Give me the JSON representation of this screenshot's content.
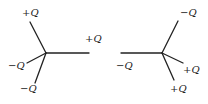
{
  "figures": [
    {
      "name": "left-configuration",
      "center": [
        46,
        53
      ],
      "arms": [
        {
          "end": [
            30,
            22
          ],
          "label": "+Q",
          "label_pos": [
            22,
            16
          ]
        },
        {
          "end": [
            89,
            53
          ],
          "label": "+Q",
          "label_pos": [
            85,
            42
          ]
        },
        {
          "end": [
            27,
            63
          ],
          "label": "−Q",
          "label_pos": [
            8,
            69
          ]
        },
        {
          "end": [
            35,
            83
          ],
          "label": "−Q",
          "label_pos": [
            20,
            92
          ]
        }
      ]
    },
    {
      "name": "right-configuration",
      "center": [
        162,
        53
      ],
      "arms": [
        {
          "end": [
            178,
            21
          ],
          "label": "−Q",
          "label_pos": [
            180,
            16
          ]
        },
        {
          "end": [
            121,
            53
          ],
          "label": "−Q",
          "label_pos": [
            116,
            69
          ]
        },
        {
          "end": [
            183,
            63
          ],
          "label": "+Q",
          "label_pos": [
            183,
            73
          ]
        },
        {
          "end": [
            174,
            80
          ],
          "label": "+Q",
          "label_pos": [
            170,
            92
          ]
        }
      ]
    }
  ],
  "colors": {
    "ink": "#222222",
    "background": "#ffffff"
  }
}
